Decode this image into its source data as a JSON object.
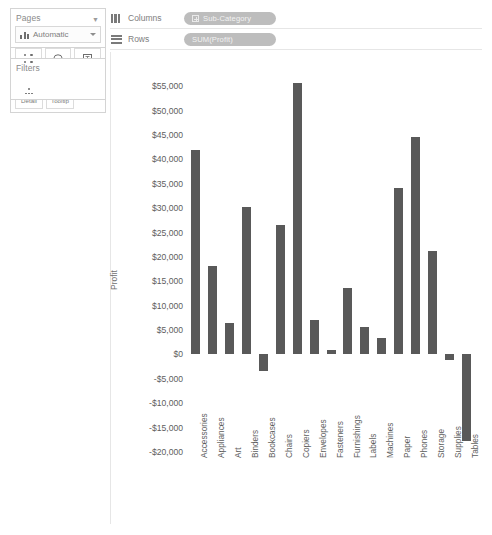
{
  "sidebar": {
    "pages": {
      "label": "Pages",
      "caret": "chevron-down-icon"
    },
    "filters": {
      "label": "Filters"
    },
    "marks": {
      "label": "Marks",
      "type_value": "Automatic",
      "buttons": [
        {
          "label": "Color",
          "icon": "color-dots-icon"
        },
        {
          "label": "Size",
          "icon": "size-circle-icon"
        },
        {
          "label": "Label",
          "icon": "label-box-icon"
        },
        {
          "label": "Detail",
          "icon": "detail-cluster-icon"
        },
        {
          "label": "Tooltip",
          "icon": "tooltip-bubble-icon"
        }
      ]
    }
  },
  "shelves": {
    "columns": {
      "label": "Columns",
      "pill": "Sub-Category",
      "icon": "columns-icon"
    },
    "rows": {
      "label": "Rows",
      "pill": "SUM(Profit)",
      "icon": "rows-icon"
    }
  },
  "chart_data": {
    "type": "bar",
    "title": "",
    "xlabel": "",
    "ylabel": "Profit",
    "ylim": [
      -20000,
      57500
    ],
    "grid": false,
    "legend": null,
    "bar_color": "#595959",
    "ytick_labels": [
      "$55,000",
      "$50,000",
      "$45,000",
      "$40,000",
      "$35,000",
      "$30,000",
      "$25,000",
      "$20,000",
      "$15,000",
      "$10,000",
      "$5,000",
      "$0",
      "-$5,000",
      "-$10,000",
      "-$15,000",
      "-$20,000"
    ],
    "ytick_values": [
      55000,
      50000,
      45000,
      40000,
      35000,
      30000,
      25000,
      20000,
      15000,
      10000,
      5000,
      0,
      -5000,
      -10000,
      -15000,
      -20000
    ],
    "categories": [
      "Accessories",
      "Appliances",
      "Art",
      "Binders",
      "Bookcases",
      "Chairs",
      "Copiers",
      "Envelopes",
      "Fasteners",
      "Furnishings",
      "Labels",
      "Machines",
      "Paper",
      "Phones",
      "Storage",
      "Supplies",
      "Tables"
    ],
    "values": [
      41937,
      18138,
      6528,
      30222,
      -3473,
      26590,
      55618,
      6964,
      950,
      13600,
      5546,
      3385,
      34054,
      44516,
      21279,
      -1189,
      -17725
    ]
  }
}
